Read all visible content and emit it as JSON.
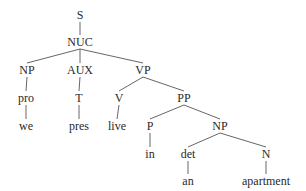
{
  "diagram": {
    "type": "syntax-tree",
    "nodes": [
      {
        "id": "S",
        "label": "S",
        "x": 80,
        "y": 15
      },
      {
        "id": "NUC",
        "label": "NUC",
        "x": 80,
        "y": 42
      },
      {
        "id": "NP1",
        "label": "NP",
        "x": 27,
        "y": 70
      },
      {
        "id": "AUX",
        "label": "AUX",
        "x": 80,
        "y": 70
      },
      {
        "id": "VP",
        "label": "VP",
        "x": 143,
        "y": 70
      },
      {
        "id": "pro",
        "label": "pro",
        "x": 26,
        "y": 98
      },
      {
        "id": "T",
        "label": "T",
        "x": 79,
        "y": 98
      },
      {
        "id": "V",
        "label": "V",
        "x": 119,
        "y": 98
      },
      {
        "id": "PP",
        "label": "PP",
        "x": 184,
        "y": 98
      },
      {
        "id": "we",
        "label": "we",
        "x": 26,
        "y": 126
      },
      {
        "id": "pres",
        "label": "pres",
        "x": 79,
        "y": 126
      },
      {
        "id": "live",
        "label": "live",
        "x": 117,
        "y": 126
      },
      {
        "id": "P",
        "label": "P",
        "x": 150,
        "y": 126
      },
      {
        "id": "NP2",
        "label": "NP",
        "x": 220,
        "y": 126
      },
      {
        "id": "in",
        "label": "in",
        "x": 150,
        "y": 154
      },
      {
        "id": "det",
        "label": "det",
        "x": 188,
        "y": 154
      },
      {
        "id": "N",
        "label": "N",
        "x": 266,
        "y": 154
      },
      {
        "id": "an",
        "label": "an",
        "x": 188,
        "y": 181
      },
      {
        "id": "apartment",
        "label": "apartment",
        "x": 266,
        "y": 181
      }
    ],
    "edges": [
      [
        "S",
        "NUC"
      ],
      [
        "NUC",
        "NP1"
      ],
      [
        "NUC",
        "AUX"
      ],
      [
        "NUC",
        "VP"
      ],
      [
        "NP1",
        "pro"
      ],
      [
        "pro",
        "we"
      ],
      [
        "AUX",
        "T"
      ],
      [
        "T",
        "pres"
      ],
      [
        "VP",
        "V"
      ],
      [
        "VP",
        "PP"
      ],
      [
        "V",
        "live"
      ],
      [
        "PP",
        "P"
      ],
      [
        "PP",
        "NP2"
      ],
      [
        "P",
        "in"
      ],
      [
        "NP2",
        "det"
      ],
      [
        "NP2",
        "N"
      ],
      [
        "det",
        "an"
      ],
      [
        "N",
        "apartment"
      ]
    ]
  }
}
